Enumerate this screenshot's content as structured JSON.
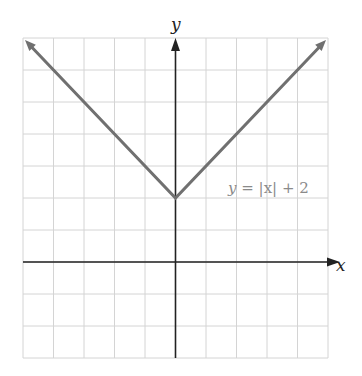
{
  "chart_data": {
    "type": "line",
    "title": "",
    "equation_label": "y = |x| + 2",
    "xlabel": "x",
    "ylabel": "y",
    "xlim": [
      -5,
      5
    ],
    "ylim": [
      -3,
      7
    ],
    "grid": true,
    "grid_step": 1,
    "tick_labels_shown": false,
    "series": [
      {
        "name": "y = |x| + 2",
        "x": [
          -5,
          0,
          5
        ],
        "y": [
          7,
          2,
          7
        ],
        "arrows_at_ends": true
      }
    ],
    "annotations": [
      {
        "text": "y = |x| + 2",
        "x": 3.1,
        "y": 2.5
      }
    ]
  },
  "colors": {
    "grid": "#d4d4d4",
    "axis": "#222222",
    "curve": "#707070",
    "label": "#8a8a8a"
  },
  "labels": {
    "x_axis": "x",
    "y_axis": "y",
    "equation_prefix": "y = ",
    "equation_abs": "|x|",
    "equation_suffix": " + 2"
  }
}
